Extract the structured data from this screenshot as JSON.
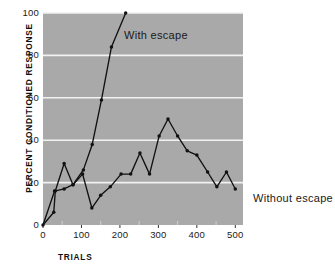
{
  "chart_data": {
    "type": "line",
    "title": "",
    "xlabel": "TRIALS",
    "ylabel": "PERCENT CONDITIONED RESPONSE",
    "xlim": [
      0,
      520
    ],
    "ylim": [
      0,
      100
    ],
    "xticks": [
      0,
      100,
      200,
      300,
      400,
      500
    ],
    "yticks": [
      0,
      20,
      40,
      60,
      80,
      100
    ],
    "xminorticks": [
      50,
      150,
      250,
      350,
      450
    ],
    "grid": "horizontal-white-gridlines",
    "background": "#a9a9a9",
    "line_color": "#111111",
    "marker": "filled-circle",
    "legend_position": "inline-annotations",
    "series": [
      {
        "name": "With escape",
        "label": "With escape",
        "points": [
          {
            "x": 0,
            "y": 0
          },
          {
            "x": 30,
            "y": 16
          },
          {
            "x": 55,
            "y": 17
          },
          {
            "x": 78,
            "y": 19
          },
          {
            "x": 105,
            "y": 26
          },
          {
            "x": 128,
            "y": 38
          },
          {
            "x": 152,
            "y": 59
          },
          {
            "x": 178,
            "y": 84
          },
          {
            "x": 215,
            "y": 100
          }
        ]
      },
      {
        "name": "Without escape",
        "label": "Without escape",
        "points": [
          {
            "x": 0,
            "y": 0
          },
          {
            "x": 28,
            "y": 6
          },
          {
            "x": 32,
            "y": 16
          },
          {
            "x": 55,
            "y": 29
          },
          {
            "x": 78,
            "y": 19
          },
          {
            "x": 103,
            "y": 24
          },
          {
            "x": 127,
            "y": 8
          },
          {
            "x": 150,
            "y": 14
          },
          {
            "x": 175,
            "y": 18
          },
          {
            "x": 203,
            "y": 24
          },
          {
            "x": 228,
            "y": 24
          },
          {
            "x": 252,
            "y": 34
          },
          {
            "x": 277,
            "y": 24
          },
          {
            "x": 302,
            "y": 42
          },
          {
            "x": 325,
            "y": 50
          },
          {
            "x": 350,
            "y": 42
          },
          {
            "x": 375,
            "y": 35
          },
          {
            "x": 400,
            "y": 33
          },
          {
            "x": 428,
            "y": 25
          },
          {
            "x": 452,
            "y": 18
          },
          {
            "x": 477,
            "y": 25
          },
          {
            "x": 500,
            "y": 17
          }
        ]
      }
    ]
  },
  "axes": {
    "y_tick_labels": [
      "100",
      "80",
      "60",
      "40",
      "20",
      "0"
    ],
    "x_tick_labels": [
      "0",
      "100",
      "200",
      "300",
      "400",
      "500"
    ],
    "y_title": "PERCENT CONDITIONED RESPONSE",
    "x_title": "TRIALS"
  },
  "annotations": {
    "with_escape": "With escape",
    "without_escape": "Without escape"
  }
}
